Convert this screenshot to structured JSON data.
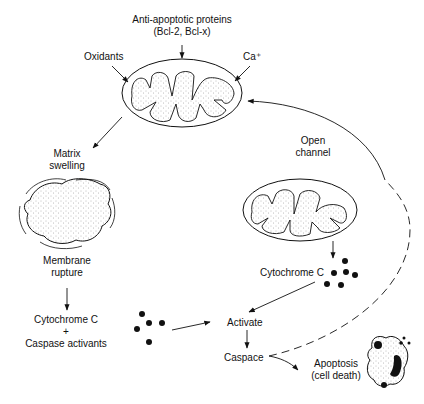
{
  "labels": {
    "anti_apoptotic_line1": "Anti-apoptotic proteins",
    "anti_apoptotic_line2": "(Bcl-2, Bcl-x)",
    "oxidants": "Oxidants",
    "calcium": "Ca⁺",
    "open_channel_line1": "Open",
    "open_channel_line2": "channel",
    "matrix_swelling_line1": "Matrix",
    "matrix_swelling_line2": "swelling",
    "membrane_rupture_line1": "Membrane",
    "membrane_rupture_line2": "rupture",
    "cytochrome_left": "Cytochrome C",
    "plus": "+",
    "caspase_activants": "Caspase activants",
    "cytochrome_right": "Cytochrome C",
    "activate": "Activate",
    "caspace": "Caspace",
    "apoptosis_line1": "Apoptosis",
    "apoptosis_line2": "(cell death)"
  },
  "colors": {
    "ink": "#111111",
    "stipple": "#888888",
    "background": "#ffffff"
  }
}
